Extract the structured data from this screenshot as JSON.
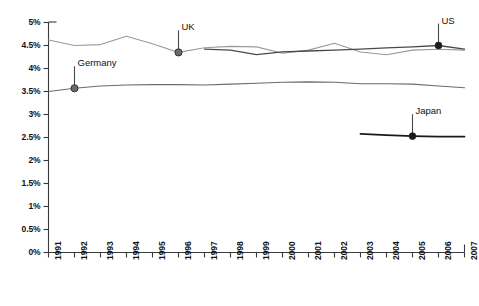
{
  "chart_data": {
    "type": "line",
    "title": "",
    "subtitle": "",
    "xlabel": "",
    "ylabel": "",
    "xlim": [
      1991,
      2007
    ],
    "ylim": [
      0,
      5
    ],
    "y_unit": "%",
    "grid": false,
    "legend": "inline-annotations",
    "x_tick_labels": [
      "1991",
      "1992",
      "1993",
      "1994",
      "1995",
      "1996",
      "1997",
      "1998",
      "1999",
      "2000",
      "2001",
      "2002",
      "2003",
      "2004",
      "2005",
      "2006",
      "2007"
    ],
    "y_tick_labels": [
      "0%",
      "0.5%",
      "1%",
      "1.5%",
      "2%",
      "2.5%",
      "3%",
      "3.5%",
      "4%",
      "4.5%",
      "5%"
    ],
    "y_ticks": [
      0,
      0.5,
      1,
      1.5,
      2,
      2.5,
      3,
      3.5,
      4,
      4.5,
      5
    ],
    "series": [
      {
        "name": "UK",
        "color": "#9a9a9a",
        "width": 1.1,
        "x": [
          1991,
          1992,
          1993,
          1994,
          1995,
          1996,
          1997,
          1998,
          1999,
          2000,
          2001,
          2002,
          2003,
          2004,
          2005,
          2006,
          2007
        ],
        "values": [
          4.62,
          4.5,
          4.52,
          4.7,
          4.54,
          4.35,
          4.45,
          4.48,
          4.47,
          4.33,
          4.4,
          4.55,
          4.36,
          4.3,
          4.4,
          4.42,
          4.4
        ],
        "marker": {
          "year": 1996,
          "value": 4.35,
          "label": "UK"
        }
      },
      {
        "name": "US",
        "color": "#4a4a4a",
        "width": 1.3,
        "x": [
          1997,
          1998,
          1999,
          2000,
          2001,
          2002,
          2003,
          2004,
          2005,
          2006,
          2007
        ],
        "values": [
          4.42,
          4.4,
          4.3,
          4.36,
          4.38,
          4.4,
          4.42,
          4.45,
          4.47,
          4.5,
          4.42
        ],
        "marker": {
          "year": 2006,
          "value": 4.5,
          "label": "US"
        }
      },
      {
        "name": "Germany",
        "color": "#6b6b6b",
        "width": 1.1,
        "x": [
          1991,
          1992,
          1993,
          1994,
          1995,
          1996,
          1997,
          1998,
          1999,
          2000,
          2001,
          2002,
          2003,
          2004,
          2005,
          2006,
          2007
        ],
        "values": [
          3.5,
          3.57,
          3.62,
          3.64,
          3.65,
          3.65,
          3.64,
          3.66,
          3.68,
          3.7,
          3.71,
          3.7,
          3.67,
          3.67,
          3.66,
          3.62,
          3.58
        ],
        "marker": {
          "year": 1992,
          "value": 3.57,
          "label": "Germany"
        }
      },
      {
        "name": "Japan",
        "color": "#1a1a1a",
        "width": 1.8,
        "x": [
          2003,
          2004,
          2005,
          2006,
          2007
        ],
        "values": [
          2.58,
          2.55,
          2.53,
          2.52,
          2.52
        ],
        "marker": {
          "year": 2005,
          "value": 2.53,
          "label": "Japan"
        }
      }
    ],
    "annotations": [
      {
        "label": "UK",
        "year": 1996,
        "value": 4.35
      },
      {
        "label": "Germany",
        "year": 1992,
        "value": 3.57
      },
      {
        "label": "US",
        "year": 2006,
        "value": 4.5
      },
      {
        "label": "Japan",
        "year": 2005,
        "value": 2.53
      }
    ],
    "axis_color": "#3a3a3a",
    "marker_fill": "#6b6b6b",
    "marker_stroke": "#2a2a2a"
  }
}
